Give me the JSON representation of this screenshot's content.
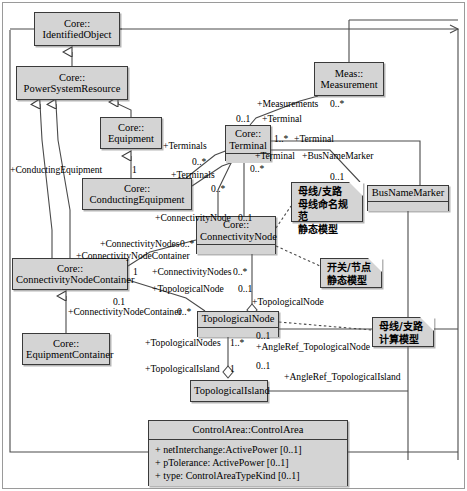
{
  "diagram": {
    "classes": [
      {
        "id": "identifiedObject",
        "name_line1": "Core::",
        "name_line2": "IdentifiedObject",
        "x": 34,
        "y": 12,
        "w": 86,
        "h": 34,
        "compartments": 0
      },
      {
        "id": "powerSystemResource",
        "name_line1": "Core::",
        "name_line2": "PowerSystemResource",
        "x": 16,
        "y": 66,
        "w": 112,
        "h": 34,
        "compartments": 0
      },
      {
        "id": "equipment",
        "name_line1": "Core::",
        "name_line2": "Equipment",
        "x": 100,
        "y": 117,
        "w": 62,
        "h": 32,
        "compartments": 0
      },
      {
        "id": "conductingEquipment",
        "name_line1": "Core::",
        "name_line2": "ConductingEquipment",
        "x": 82,
        "y": 178,
        "w": 110,
        "h": 32,
        "compartments": 0
      },
      {
        "id": "terminal",
        "name_line1": "Core::",
        "name_line2": "Terminal",
        "x": 225,
        "y": 125,
        "w": 46,
        "h": 36,
        "compartments": 1
      },
      {
        "id": "measurement",
        "name_line1": "Meas::",
        "name_line2": "Measurement",
        "x": 314,
        "y": 62,
        "w": 70,
        "h": 34,
        "compartments": 0
      },
      {
        "id": "busNameMarker",
        "name_line1": "",
        "name_line2": "BusNameMarker",
        "x": 367,
        "y": 185,
        "w": 82,
        "h": 26,
        "compartments": 1
      },
      {
        "id": "connectivityNode",
        "name_line1": "Core::",
        "name_line2": "ConnectivityNode",
        "x": 196,
        "y": 216,
        "w": 80,
        "h": 38,
        "compartments": 1
      },
      {
        "id": "connectivityNodeContainer",
        "name_line1": "Core::",
        "name_line2": "ConnectivityNodeContainer",
        "x": 12,
        "y": 258,
        "w": 116,
        "h": 32,
        "compartments": 0
      },
      {
        "id": "equipmentContainer",
        "name_line1": "Core::",
        "name_line2": "EquipmentContainer",
        "x": 22,
        "y": 333,
        "w": 88,
        "h": 32,
        "compartments": 0
      },
      {
        "id": "topologicalNode",
        "name_line1": "",
        "name_line2": "TopologicalNode",
        "x": 197,
        "y": 311,
        "w": 82,
        "h": 26,
        "compartments": 1
      },
      {
        "id": "topologicalIsland",
        "name_line1": "",
        "name_line2": "TopologicalIsland",
        "x": 190,
        "y": 380,
        "w": 78,
        "h": 22,
        "compartments": 0
      }
    ],
    "control_area": {
      "id": "controlArea",
      "title": "ControlArea::ControlArea",
      "x": 148,
      "y": 420,
      "w": 200,
      "h": 66,
      "attributes": [
        "+  netInterchange:ActivePower [0..1]",
        "+  pTolerance: ActivePower [0..1]",
        "+  type: ControlAreaTypeKind [0..1]"
      ]
    },
    "notes": [
      {
        "id": "note-bus-naming",
        "x": 291,
        "y": 182,
        "w": 72,
        "h": 38,
        "lines": [
          "母线/支路",
          "母线命名规范",
          "静态模型"
        ]
      },
      {
        "id": "note-switch-node",
        "x": 320,
        "y": 258,
        "w": 62,
        "h": 30,
        "lines": [
          "开关/节点",
          "静态模型"
        ]
      },
      {
        "id": "note-bus-calc",
        "x": 372,
        "y": 317,
        "w": 62,
        "h": 30,
        "lines": [
          "母线/支路",
          "计算模型"
        ]
      }
    ],
    "labels": [
      {
        "id": "lbl-measurements",
        "text": "+Measurements",
        "x": 257,
        "y": 98
      },
      {
        "id": "lbl-measurements-mult",
        "text": "0..*",
        "x": 330,
        "y": 98
      },
      {
        "id": "lbl-terminal-01",
        "text": "0..1",
        "x": 236,
        "y": 113
      },
      {
        "id": "lbl-terminal-a",
        "text": "+Terminal",
        "x": 262,
        "y": 113
      },
      {
        "id": "lbl-terminal-1star",
        "text": "1..*",
        "x": 274,
        "y": 133
      },
      {
        "id": "lbl-terminal-b",
        "text": "+Terminal",
        "x": 294,
        "y": 133
      },
      {
        "id": "lbl-terminal-c",
        "text": "+Terminal",
        "x": 255,
        "y": 150
      },
      {
        "id": "lbl-terminal-c-mult",
        "text": "0..*",
        "x": 250,
        "y": 163
      },
      {
        "id": "lbl-terminals-a",
        "text": "+Terminals",
        "x": 163,
        "y": 140
      },
      {
        "id": "lbl-terminals-a-mult",
        "text": "0..*",
        "x": 192,
        "y": 156
      },
      {
        "id": "lbl-terminals-b",
        "text": "+Terminals",
        "x": 171,
        "y": 169
      },
      {
        "id": "lbl-terminals-b-mult",
        "text": "0..*",
        "x": 211,
        "y": 183
      },
      {
        "id": "lbl-busnamemarker",
        "text": "+BusNameMarker",
        "x": 302,
        "y": 150
      },
      {
        "id": "lbl-busnamemarker-mult",
        "text": "0..1",
        "x": 330,
        "y": 171
      },
      {
        "id": "lbl-conducting-equipment",
        "text": "+ConductingEquipment",
        "x": 10,
        "y": 164
      },
      {
        "id": "lbl-conducting-equipment-mult",
        "text": "1",
        "x": 132,
        "y": 164
      },
      {
        "id": "lbl-connectivitynode-a",
        "text": "+ConnectivityNode",
        "x": 155,
        "y": 212
      },
      {
        "id": "lbl-connectivitynode-a-mult",
        "text": "0..1",
        "x": 238,
        "y": 212
      },
      {
        "id": "lbl-connectivitynodes-a",
        "text": "+ConnectivityNodes",
        "x": 100,
        "y": 238
      },
      {
        "id": "lbl-connectivitynodes-a-mult",
        "text": "0..*",
        "x": 180,
        "y": 238
      },
      {
        "id": "lbl-connectivitynodecontainer-a",
        "text": "+ConnectivityNodeContainer",
        "x": 76,
        "y": 250
      },
      {
        "id": "lbl-cnc-mult",
        "text": "1",
        "x": 133,
        "y": 266
      },
      {
        "id": "lbl-connectivitynodes-b",
        "text": "+ConnectivityNodes",
        "x": 152,
        "y": 266
      },
      {
        "id": "lbl-connectivitynodes-b-mult",
        "text": "0..*",
        "x": 233,
        "y": 266
      },
      {
        "id": "lbl-topologicalnode-a",
        "text": "+TopologicalNode",
        "x": 152,
        "y": 283
      },
      {
        "id": "lbl-topologicalnode-a-mult",
        "text": "0..1",
        "x": 238,
        "y": 283
      },
      {
        "id": "lbl-topologicalnode-b",
        "text": "+TopologicalNode",
        "x": 252,
        "y": 296
      },
      {
        "id": "lbl-connectivitynodecontainer-b",
        "text": "+ConnectivityNodeContainer",
        "x": 68,
        "y": 306
      },
      {
        "id": "lbl-cnc-b-mult",
        "text": "0..*",
        "x": 177,
        "y": 306
      },
      {
        "id": "lbl-cnc-01",
        "text": "0.1",
        "x": 113,
        "y": 296
      },
      {
        "id": "lbl-topologicalnodes",
        "text": "+TopologicalNodes",
        "x": 145,
        "y": 337
      },
      {
        "id": "lbl-topologicalnodes-mult",
        "text": "1..*",
        "x": 230,
        "y": 337
      },
      {
        "id": "lbl-angleref-node-mult",
        "text": "0..1",
        "x": 256,
        "y": 330
      },
      {
        "id": "lbl-angleref-node",
        "text": "+AngleRef_TopologicalNode",
        "x": 256,
        "y": 341
      },
      {
        "id": "lbl-topologicalisland",
        "text": "+TopologicalIsland",
        "x": 145,
        "y": 363
      },
      {
        "id": "lbl-topologicalisland-mult",
        "text": "1",
        "x": 230,
        "y": 363
      },
      {
        "id": "lbl-angleref-island-mult",
        "text": "0..1",
        "x": 256,
        "y": 360
      },
      {
        "id": "lbl-angleref-island",
        "text": "+AngleRef_TopologicalIsland",
        "x": 284,
        "y": 371
      }
    ]
  },
  "colors": {
    "box_fill": "#d4d4d4",
    "box_border": "#3a3a3a",
    "line": "#4a4a4a",
    "background": "#ffffff"
  }
}
